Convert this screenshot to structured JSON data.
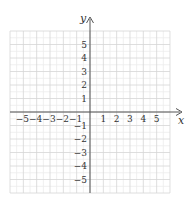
{
  "graph": {
    "x_label": "x",
    "y_label": "y",
    "x_ticks": [
      "−5",
      "−4",
      "−3",
      "−2",
      "−1",
      "1",
      "2",
      "3",
      "4",
      "5"
    ],
    "x_tick_values": [
      -5,
      -4,
      -3,
      -2,
      -1,
      1,
      2,
      3,
      4,
      5
    ],
    "y_ticks": [
      "5",
      "4",
      "3",
      "2",
      "1",
      "−1",
      "−2",
      "−3",
      "−4",
      "−5"
    ],
    "y_tick_values": [
      5,
      4,
      3,
      2,
      1,
      -1,
      -2,
      -3,
      -4,
      -5
    ],
    "grid_range": {
      "x": [
        -6,
        6
      ],
      "y": [
        -6,
        6
      ]
    },
    "colors": {
      "major_grid": "#d6d6d6",
      "minor_grid": "#ececec",
      "axis": "#555555",
      "text": "#333333"
    }
  }
}
